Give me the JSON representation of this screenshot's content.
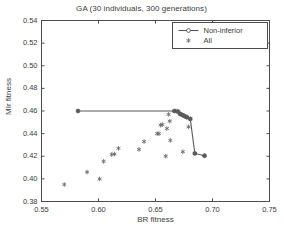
{
  "chart_data": {
    "type": "scatter",
    "title": "GA (30 individuals, 300 generations)",
    "xlabel": "BR fitness",
    "ylabel": "MIr fitness",
    "xlim": [
      0.55,
      0.75
    ],
    "ylim": [
      0.38,
      0.54
    ],
    "xticks": [
      "0.55",
      "0.60",
      "0.65",
      "0.70",
      "0.75"
    ],
    "xtick_values": [
      0.55,
      0.6,
      0.65,
      0.7,
      0.75
    ],
    "yticks": [
      "0.38",
      "0.40",
      "0.42",
      "0.44",
      "0.46",
      "0.48",
      "0.50",
      "0.52",
      "0.54"
    ],
    "ytick_values": [
      0.38,
      0.4,
      0.42,
      0.44,
      0.46,
      0.48,
      0.5,
      0.52,
      0.54
    ],
    "grid": false,
    "legend_position": "top-right",
    "series": [
      {
        "name": "Non-inferior",
        "marker": "circle",
        "line": true,
        "color": "#5a5a5a",
        "points": [
          [
            0.582,
            0.46
          ],
          [
            0.6665,
            0.46
          ],
          [
            0.6695,
            0.4595
          ],
          [
            0.6715,
            0.4575
          ],
          [
            0.6735,
            0.4565
          ],
          [
            0.6755,
            0.4555
          ],
          [
            0.6775,
            0.4545
          ],
          [
            0.6805,
            0.453
          ],
          [
            0.6845,
            0.4225
          ],
          [
            0.693,
            0.4205
          ]
        ]
      },
      {
        "name": "All",
        "marker": "asterisk",
        "line": false,
        "color": "#6b6b6b",
        "points": [
          [
            0.57,
            0.395
          ],
          [
            0.59,
            0.406
          ],
          [
            0.601,
            0.4
          ],
          [
            0.6045,
            0.4155
          ],
          [
            0.6115,
            0.4215
          ],
          [
            0.614,
            0.422
          ],
          [
            0.6175,
            0.427
          ],
          [
            0.6355,
            0.426
          ],
          [
            0.64,
            0.433
          ],
          [
            0.6515,
            0.44
          ],
          [
            0.653,
            0.44
          ],
          [
            0.6545,
            0.4475
          ],
          [
            0.656,
            0.448
          ],
          [
            0.659,
            0.42
          ],
          [
            0.66,
            0.4445
          ],
          [
            0.6615,
            0.457
          ],
          [
            0.6625,
            0.451
          ],
          [
            0.663,
            0.434
          ],
          [
            0.668,
            0.46
          ],
          [
            0.67,
            0.4595
          ],
          [
            0.6715,
            0.4575
          ],
          [
            0.6735,
            0.4565
          ],
          [
            0.6755,
            0.4555
          ],
          [
            0.6775,
            0.4545
          ],
          [
            0.679,
            0.446
          ],
          [
            0.6805,
            0.453
          ],
          [
            0.674,
            0.424
          ],
          [
            0.6845,
            0.4225
          ],
          [
            0.693,
            0.4205
          ]
        ]
      }
    ]
  },
  "legend": {
    "entries": [
      {
        "label": "Non-inferior",
        "marker": "circle-line"
      },
      {
        "label": "All",
        "marker": "asterisk"
      }
    ]
  },
  "colors": {
    "axis": "#4d4d4d",
    "text": "#3d3d3d",
    "series_nondominated": "#5a5a5a",
    "series_all": "#6b6b6b",
    "background": "#ffffff"
  }
}
